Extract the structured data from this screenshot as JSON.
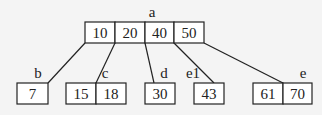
{
  "diagram": {
    "type": "b-tree",
    "root": {
      "label": "a",
      "keys": [
        "10",
        "20",
        "40",
        "50"
      ]
    },
    "children": [
      {
        "label": "b",
        "keys": [
          "7"
        ]
      },
      {
        "label": "c",
        "keys": [
          "15",
          "18"
        ]
      },
      {
        "label": "d",
        "keys": [
          "30"
        ]
      },
      {
        "label": "e1",
        "keys": [
          "43"
        ]
      },
      {
        "label": "e",
        "keys": [
          "61",
          "70"
        ]
      }
    ],
    "colors": {
      "background": "#f4f4f4",
      "node_fill": "#ffffff",
      "stroke": "#222222"
    }
  }
}
